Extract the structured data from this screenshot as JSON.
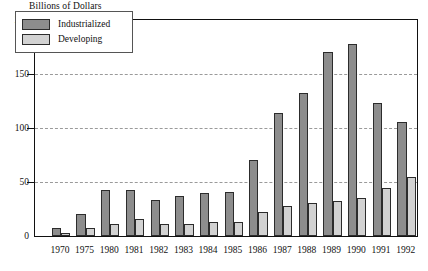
{
  "chart_data": {
    "type": "bar",
    "title": "",
    "ylabel": "Billions of Dollars",
    "xlabel": "",
    "ylim": [
      0,
      200
    ],
    "yticks": [
      0,
      50,
      100,
      150,
      200
    ],
    "grid": true,
    "legend_position": "top-left",
    "categories": [
      "1970",
      "1975",
      "1980",
      "1981",
      "1982",
      "1983",
      "1984",
      "1985",
      "1986",
      "1987",
      "1988",
      "1989",
      "1990",
      "1991",
      "1992"
    ],
    "series": [
      {
        "name": "Industrialized",
        "color": "#8d8d8d",
        "values": [
          7,
          20,
          43,
          43,
          33,
          37,
          40,
          41,
          70,
          114,
          132,
          170,
          178,
          123,
          106
        ]
      },
      {
        "name": "Developing",
        "color": "#d2d2d2",
        "values": [
          3,
          7,
          11,
          16,
          11,
          11,
          13,
          13,
          22,
          28,
          31,
          32,
          35,
          44,
          55
        ]
      }
    ]
  },
  "axis": {
    "y_title": "Billions of Dollars",
    "tick_labels": [
      "200",
      "150",
      "100",
      "50",
      "0"
    ]
  },
  "legend": {
    "items": [
      {
        "label": "Industrialized",
        "swatch": "dark-gray-swatch"
      },
      {
        "label": "Developing",
        "swatch": "light-gray-swatch"
      }
    ]
  }
}
